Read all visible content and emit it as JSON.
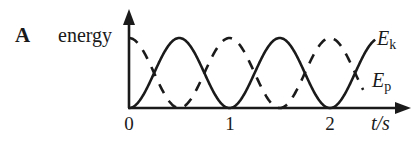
{
  "panel_label": "A",
  "chart_data": {
    "type": "line",
    "title": "",
    "xlabel": "t/s",
    "ylabel": "energy",
    "x_ticks": [
      "0",
      "1",
      "2"
    ],
    "x_tick_values": [
      0,
      1,
      2
    ],
    "xlim": [
      0,
      2.8
    ],
    "ylim": [
      0,
      1
    ],
    "y_ticks": [],
    "grid": false,
    "legend_position": "inline-right",
    "series": [
      {
        "name": "E_k",
        "label_main": "E",
        "label_sub": "k",
        "style": "solid",
        "function": "sin^2(pi t)",
        "x": [
          0,
          0.25,
          0.5,
          0.75,
          1.0,
          1.25,
          1.5,
          1.75,
          2.0,
          2.25,
          2.45
        ],
        "values": [
          0,
          0.5,
          1,
          0.5,
          0,
          0.5,
          1,
          0.5,
          0,
          0.5,
          0.98
        ]
      },
      {
        "name": "E_p",
        "label_main": "E",
        "label_sub": "p",
        "style": "dashed",
        "function": "cos^2(pi t)",
        "x": [
          0,
          0.25,
          0.5,
          0.75,
          1.0,
          1.25,
          1.5,
          1.75,
          2.0,
          2.25,
          2.33
        ],
        "values": [
          1,
          0.5,
          0,
          0.5,
          1,
          0.5,
          0,
          0.5,
          1,
          0.5,
          0.25
        ]
      }
    ],
    "colors": {
      "axis": "#1a1a1a",
      "line": "#1a1a1a"
    }
  }
}
